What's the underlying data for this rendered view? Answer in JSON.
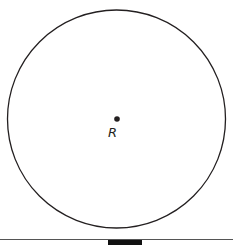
{
  "diagram": {
    "circle": {
      "cx": 116.5,
      "cy": 119,
      "r": 109,
      "stroke": "#231f20"
    },
    "center_point": {
      "x": 117,
      "y": 119,
      "label": "R"
    },
    "baseline": {
      "y": 239,
      "color": "#555555"
    },
    "bottom_block": {
      "x": 108,
      "width": 34,
      "color": "#111111"
    }
  }
}
